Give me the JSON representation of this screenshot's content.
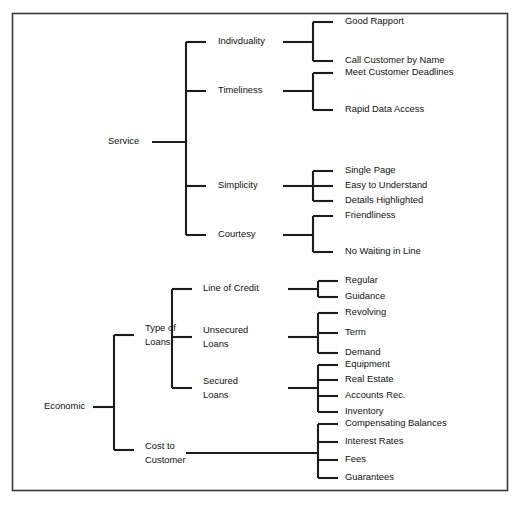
{
  "diagram": {
    "type": "tree-diagram",
    "orientation": "left-to-right",
    "frame": {
      "stroke": "#3a3a3a"
    },
    "line_color": "#1c1c1c",
    "roots": [
      {
        "id": "service",
        "label": "Service",
        "children": [
          {
            "id": "individuality",
            "label": "Indivduality",
            "leaves": [
              "Good Rapport",
              "Call Customer by Name"
            ]
          },
          {
            "id": "timeliness",
            "label": "Timeliness",
            "leaves": [
              "Meet Customer Deadlines",
              "Rapid Data Access"
            ]
          },
          {
            "id": "simplicity",
            "label": "Simplicity",
            "leaves": [
              "Single Page",
              "Easy to Understand",
              "Details Highlighted"
            ]
          },
          {
            "id": "courtesy",
            "label": "Courtesy",
            "leaves": [
              "Friendliness",
              "No Waiting in Line"
            ]
          }
        ]
      },
      {
        "id": "economic",
        "label": "Economic",
        "children": [
          {
            "id": "type-of-loans",
            "label": "Type of Loans",
            "label_line1": "Type of",
            "label_line2": "Loans",
            "children": [
              {
                "id": "line-of-credit",
                "label": "Line of Credit",
                "label_line1": "Line of Credit",
                "label_line2": "",
                "leaves": [
                  "Regular",
                  "Guidance"
                ]
              },
              {
                "id": "unsecured-loans",
                "label": "Unsecured Loans",
                "label_line1": "Unsecured",
                "label_line2": "Loans",
                "leaves": [
                  "Revolving",
                  "Term",
                  "Demand"
                ]
              },
              {
                "id": "secured-loans",
                "label": "Secured Loans",
                "label_line1": "Secured",
                "label_line2": "Loans",
                "leaves": [
                  "Equipment",
                  "Real Estate",
                  "Accounts Rec.",
                  "Inventory"
                ]
              }
            ]
          },
          {
            "id": "cost-to-customer",
            "label": "Cost to Customer",
            "label_line1": "Cost to",
            "label_line2": "Customer",
            "leaves": [
              "Compensating Balances",
              "Interest Rates",
              "Fees",
              "Guarantees"
            ]
          }
        ]
      }
    ]
  }
}
